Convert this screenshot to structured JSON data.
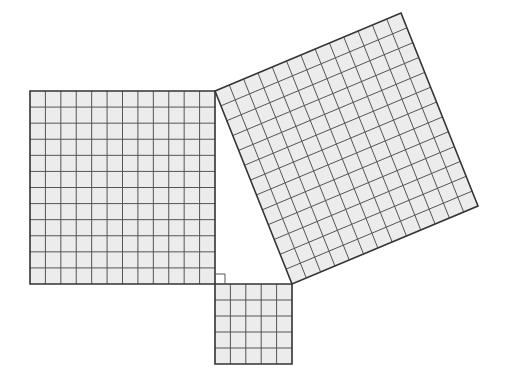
{
  "diagram": {
    "colors": {
      "background": "#ffffff",
      "cell_fill": "#ececec",
      "grid_line": "#555555",
      "border": "#333333"
    },
    "triangle": {
      "right_angle_vertex": [
        215,
        284
      ],
      "vertex_top": [
        215,
        91
      ],
      "vertex_right": [
        292,
        284
      ],
      "right_angle_marker_size": 10
    },
    "squares": [
      {
        "name": "leg-a-square",
        "units": 12,
        "area": 144,
        "corners": [
          [
            30,
            91
          ],
          [
            215,
            91
          ],
          [
            215,
            284
          ],
          [
            30,
            284
          ]
        ]
      },
      {
        "name": "leg-b-square",
        "units": 5,
        "area": 25,
        "corners": [
          [
            215,
            284
          ],
          [
            292,
            284
          ],
          [
            292,
            364
          ],
          [
            215,
            364
          ]
        ]
      },
      {
        "name": "hypotenuse-square",
        "units": 13,
        "area": 169,
        "corners": [
          [
            215,
            91
          ],
          [
            401,
            13
          ],
          [
            478,
            206
          ],
          [
            292,
            284
          ]
        ]
      }
    ]
  }
}
